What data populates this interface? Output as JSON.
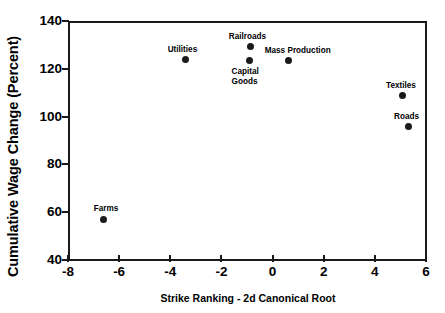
{
  "chart_data": {
    "type": "scatter",
    "title": "",
    "xlabel": "Strike Ranking - 2d Canonical Root",
    "ylabel": "Cumulative Wage Change (Percent)",
    "xlim": [
      -8,
      6
    ],
    "ylim": [
      40,
      140
    ],
    "xticks": [
      -8,
      -6,
      -4,
      -2,
      0,
      2,
      4,
      6
    ],
    "xtick_labels": [
      "-8",
      "-6",
      "-4",
      "-2",
      "0",
      "2",
      "4",
      "6"
    ],
    "yticks": [
      40,
      60,
      80,
      100,
      120,
      140
    ],
    "ytick_labels": [
      "40",
      "60",
      "80",
      "100",
      "120",
      "140"
    ],
    "grid": false,
    "legend": false,
    "marker_color": "#1a1a1a",
    "frame_color": "#1a1a1a",
    "background": "#ffffff",
    "points": [
      {
        "label": "Farms",
        "x": -6.6,
        "y": 57.0,
        "label_dx": -10,
        "label_dy": -15,
        "align": "left"
      },
      {
        "label": "Utilities",
        "x": -3.4,
        "y": 123.7,
        "label_dx": -18,
        "label_dy": -15,
        "align": "left"
      },
      {
        "label": "Railroads",
        "x": -0.85,
        "y": 129.2,
        "label_dx": -22,
        "label_dy": -15,
        "align": "left"
      },
      {
        "label": "Capital\nGoods",
        "x": -0.9,
        "y": 123.3,
        "label_dx": -18,
        "label_dy": 6,
        "align": "left"
      },
      {
        "label": "Mass Production",
        "x": 0.63,
        "y": 123.3,
        "label_dx": -24,
        "label_dy": -15,
        "align": "left"
      },
      {
        "label": "Textiles",
        "x": 5.1,
        "y": 108.8,
        "label_dx": -17,
        "label_dy": -15,
        "align": "left"
      },
      {
        "label": "Roads",
        "x": 5.3,
        "y": 95.8,
        "label_dx": -14,
        "label_dy": -15,
        "align": "left"
      }
    ]
  }
}
